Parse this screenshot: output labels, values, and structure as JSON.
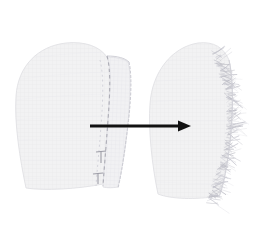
{
  "figure": {
    "title_fragment_left": "j",
    "title_fragment_right": "y",
    "background_color": "#ffffff",
    "transformation_label": ""
  },
  "arrow": {
    "name": "transformation-arrow",
    "color": "#111111",
    "direction": "left-to-right",
    "x_start": 90,
    "x_end": 191,
    "y": 126,
    "shaft_thickness": 3,
    "head_length": 13,
    "head_width": 11
  },
  "panels": [
    {
      "id": "left-panel",
      "label": "Pattern piece with seam allowance",
      "fill_color": "#f2f2f3",
      "edge_color": "#d8d8dc",
      "seam_line_color": "#b9b9c0",
      "has_seam_allowance": true,
      "has_notches": true,
      "has_fringe": false,
      "notch_count": 2,
      "bbox": {
        "x": 14,
        "y": 42,
        "width": 108,
        "height": 150
      }
    },
    {
      "id": "right-panel",
      "label": "Pattern piece with frayed edge",
      "fill_color": "#f2f2f3",
      "edge_color": "#d8d8dc",
      "seam_line_color": "#c9c9d0",
      "fringe_color": "#bdbdc6",
      "has_seam_allowance": false,
      "has_notches": false,
      "has_fringe": true,
      "fringe_strand_count": 150,
      "bbox": {
        "x": 148,
        "y": 40,
        "width": 98,
        "height": 160
      }
    }
  ],
  "texture": {
    "type": "woven-grid",
    "line_color": "#e6e6ea",
    "spacing": 4
  }
}
